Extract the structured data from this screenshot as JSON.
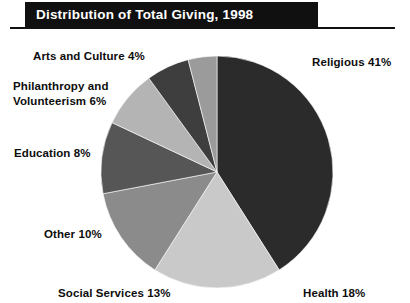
{
  "header": {
    "title": "Distribution of Total Giving, 1998"
  },
  "labels": {
    "religious": "Religious 41%",
    "health": "Health 18%",
    "social_services": "Social Services 13%",
    "other": "Other 10%",
    "education": "Education 8%",
    "philanthropy": "Philanthropy and\nVolunteerism 6%",
    "arts": "Arts and Culture 4%"
  },
  "chart_data": {
    "type": "pie",
    "title": "Distribution of Total Giving, 1998",
    "xlabel": "",
    "ylabel": "",
    "unit": "percent",
    "start_angle_deg": 0,
    "direction": "clockwise",
    "legend": "none (labels placed around pie)",
    "grid": false,
    "categories": [
      "Religious",
      "Health",
      "Social Services",
      "Other",
      "Education",
      "Philanthropy and Volunteerism",
      "Arts and Culture"
    ],
    "values": [
      41,
      18,
      13,
      10,
      8,
      6,
      4
    ],
    "labels": [
      "Religious 41%",
      "Health 18%",
      "Social Services 13%",
      "Other 10%",
      "Education 8%",
      "Philanthropy and Volunteerism 6%",
      "Arts and Culture 4%"
    ],
    "colors": [
      "#2b2b2b",
      "#c9c9c9",
      "#8b8b8b",
      "#565656",
      "#b4b4b4",
      "#3e3e3e",
      "#9b9b9b"
    ]
  },
  "style": {
    "title_bar_color": "#101010",
    "title_text_color": "#ffffff",
    "rule_color": "#111111",
    "label_color": "#0d0d0d",
    "background": "#ffffff"
  }
}
